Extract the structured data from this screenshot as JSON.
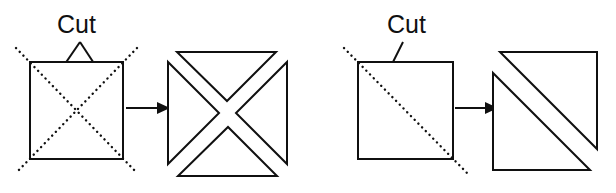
{
  "figure": {
    "background_color": "#ffffff",
    "line_color": "#101010",
    "panels": [
      {
        "id": "left-panel",
        "name": "x-cut-panel",
        "label": "Cut",
        "label_count": 1,
        "arrow_count": 2,
        "source_shape": "square-with-two-dotted-diagonals",
        "result_shape": "four-triangles-x-arrangement",
        "result_piece_count": 4
      },
      {
        "id": "right-panel",
        "name": "single-cut-panel",
        "label": "Cut",
        "label_count": 1,
        "arrow_count": 1,
        "source_shape": "square-with-one-dotted-diagonal",
        "result_shape": "two-triangles-separated",
        "result_piece_count": 2
      }
    ]
  },
  "labels": {
    "left_cut": "Cut",
    "right_cut": "Cut"
  }
}
